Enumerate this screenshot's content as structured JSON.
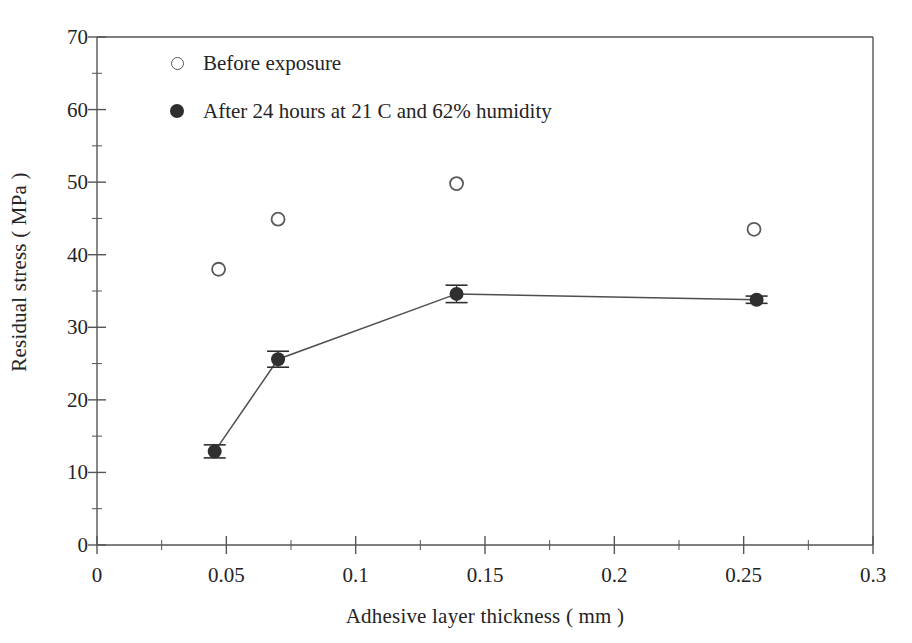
{
  "chart_data": {
    "type": "scatter",
    "title": "",
    "xlabel": "Adhesive layer thickness ( mm )",
    "ylabel": "Residual stress ( MPa )",
    "xlim": [
      0,
      0.3
    ],
    "ylim": [
      0,
      70
    ],
    "xticks": [
      0,
      0.05,
      0.1,
      0.15,
      0.2,
      0.25,
      0.3
    ],
    "xtick_labels": [
      "0",
      "0.05",
      "0.1",
      "0.15",
      "0.2",
      "0.25",
      "0.3"
    ],
    "yticks": [
      0,
      10,
      20,
      30,
      40,
      50,
      60,
      70
    ],
    "ytick_labels": [
      "0",
      "10",
      "20",
      "30",
      "40",
      "50",
      "60",
      "70"
    ],
    "x_minor_tick_step": 0.025,
    "y_minor_tick_step": 5,
    "grid": false,
    "legend_position": "upper-left-inside",
    "series": [
      {
        "name": "Before exposure",
        "marker": "open-circle",
        "color": "#5a5a5a",
        "connected": false,
        "points": [
          {
            "x": 0.047,
            "y": 38.0
          },
          {
            "x": 0.07,
            "y": 44.9
          },
          {
            "x": 0.139,
            "y": 49.8
          },
          {
            "x": 0.254,
            "y": 43.5
          }
        ]
      },
      {
        "name": "After 24 hours at 21 C and 62% humidity",
        "marker": "filled-circle",
        "color": "#2f2f2f",
        "connected": true,
        "has_error_bars": true,
        "points": [
          {
            "x": 0.0455,
            "y": 12.9,
            "yerr": 0.9
          },
          {
            "x": 0.07,
            "y": 25.6,
            "yerr": 1.1
          },
          {
            "x": 0.139,
            "y": 34.6,
            "yerr": 1.2
          },
          {
            "x": 0.255,
            "y": 33.8,
            "yerr": 0.5
          }
        ]
      }
    ]
  }
}
